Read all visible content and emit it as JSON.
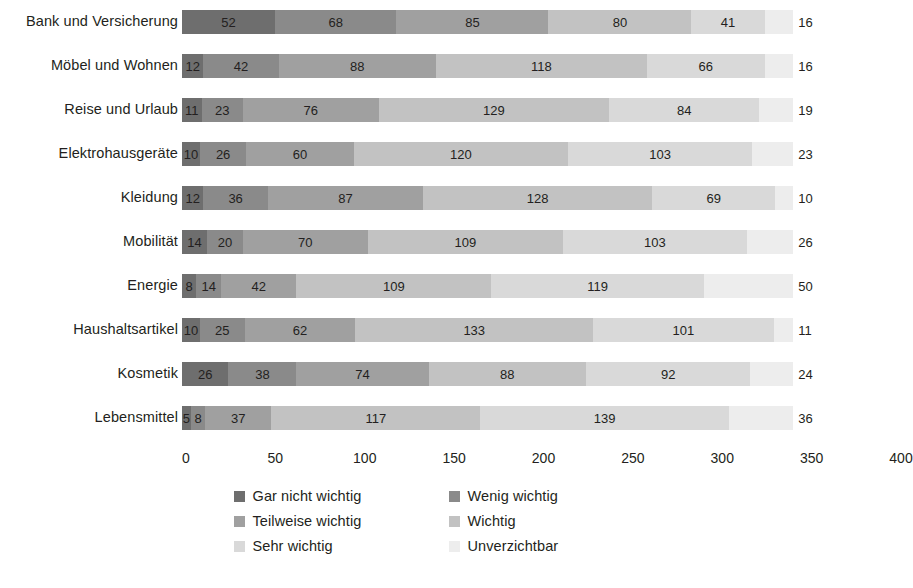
{
  "chart_data": {
    "type": "bar",
    "orientation": "horizontal",
    "stacked": true,
    "title": "",
    "subtitle": "",
    "xlabel": "",
    "ylabel": "",
    "xlim": [
      0,
      400
    ],
    "xticks": [
      0,
      50,
      100,
      150,
      200,
      250,
      300,
      350,
      400
    ],
    "xtick_labels": [
      "0",
      "50",
      "100",
      "150",
      "200",
      "250",
      "300",
      "350",
      "400"
    ],
    "grid": false,
    "legend_position": "bottom",
    "categories": [
      "Bank und Versicherung",
      "Möbel und Wohnen",
      "Reise und Urlaub",
      "Elektrohausgeräte",
      "Kleidung",
      "Mobilität",
      "Energie",
      "Haushaltsartikel",
      "Kosmetik",
      "Lebensmittel"
    ],
    "series": [
      {
        "name": "Gar nicht wichtig",
        "color": "#6e6e6e",
        "values": [
          52,
          12,
          11,
          10,
          12,
          14,
          8,
          10,
          26,
          5
        ]
      },
      {
        "name": "Wenig wichtig",
        "color": "#8a8a8a",
        "values": [
          68,
          42,
          23,
          26,
          36,
          20,
          14,
          25,
          38,
          8
        ]
      },
      {
        "name": "Teilweise wichtig",
        "color": "#a0a0a0",
        "values": [
          85,
          88,
          76,
          60,
          87,
          70,
          42,
          62,
          74,
          37
        ]
      },
      {
        "name": "Wichtig",
        "color": "#c2c2c2",
        "values": [
          80,
          118,
          129,
          120,
          128,
          109,
          109,
          133,
          88,
          117
        ]
      },
      {
        "name": "Sehr wichtig",
        "color": "#d9d9d9",
        "values": [
          41,
          66,
          84,
          103,
          69,
          103,
          119,
          101,
          92,
          139
        ]
      },
      {
        "name": "Unverzichtbar",
        "color": "#ededed",
        "values": [
          16,
          16,
          19,
          23,
          10,
          26,
          50,
          11,
          24,
          36
        ]
      }
    ],
    "totals": [
      342,
      342,
      342,
      342,
      342,
      342,
      342,
      342,
      342,
      342
    ]
  },
  "legend": {
    "items": [
      {
        "label": "Gar nicht wichtig",
        "color": "#6e6e6e"
      },
      {
        "label": "Wenig wichtig",
        "color": "#8a8a8a"
      },
      {
        "label": "Teilweise wichtig",
        "color": "#a0a0a0"
      },
      {
        "label": "Wichtig",
        "color": "#c2c2c2"
      },
      {
        "label": "Sehr wichtig",
        "color": "#d9d9d9"
      },
      {
        "label": "Unverzichtbar",
        "color": "#ededed"
      }
    ]
  }
}
